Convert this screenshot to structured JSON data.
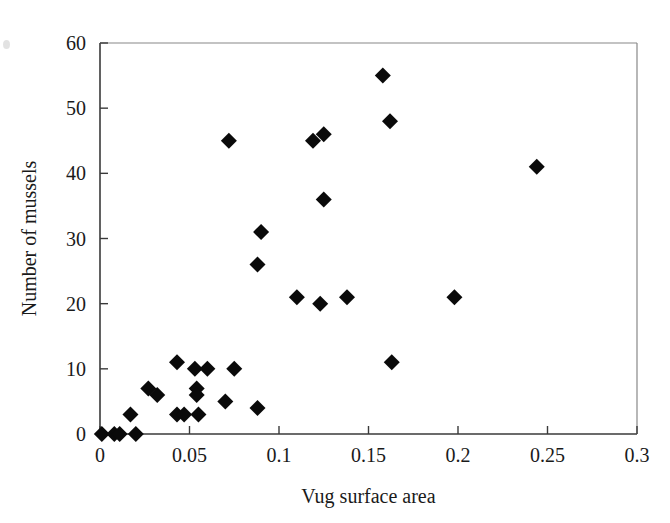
{
  "chart_data": {
    "type": "scatter",
    "title": "",
    "xlabel": "Vug surface area",
    "ylabel": "Number of mussels",
    "xlim": [
      0,
      0.3
    ],
    "ylim": [
      0,
      60
    ],
    "xticks": [
      0,
      0.05,
      0.1,
      0.15,
      0.2,
      0.25,
      0.3
    ],
    "xticklabels": [
      "0",
      "0.05",
      "0.1",
      "0.15",
      "0.2",
      "0.25",
      "0.3"
    ],
    "yticks": [
      0,
      10,
      20,
      30,
      40,
      50,
      60
    ],
    "yticklabels": [
      "0",
      "10",
      "20",
      "30",
      "40",
      "50",
      "60"
    ],
    "grid": false,
    "legend": false,
    "marker": "diamond",
    "marker_color": "#0a0a0a",
    "marker_size": 13,
    "points": [
      {
        "x": 0.001,
        "y": 0
      },
      {
        "x": 0.008,
        "y": 0
      },
      {
        "x": 0.011,
        "y": 0
      },
      {
        "x": 0.02,
        "y": 0
      },
      {
        "x": 0.017,
        "y": 3
      },
      {
        "x": 0.027,
        "y": 7
      },
      {
        "x": 0.032,
        "y": 6
      },
      {
        "x": 0.043,
        "y": 11
      },
      {
        "x": 0.043,
        "y": 3
      },
      {
        "x": 0.047,
        "y": 3
      },
      {
        "x": 0.053,
        "y": 10
      },
      {
        "x": 0.054,
        "y": 7
      },
      {
        "x": 0.054,
        "y": 6
      },
      {
        "x": 0.055,
        "y": 3
      },
      {
        "x": 0.06,
        "y": 10
      },
      {
        "x": 0.07,
        "y": 5
      },
      {
        "x": 0.072,
        "y": 45
      },
      {
        "x": 0.075,
        "y": 10
      },
      {
        "x": 0.088,
        "y": 4
      },
      {
        "x": 0.088,
        "y": 26
      },
      {
        "x": 0.09,
        "y": 31
      },
      {
        "x": 0.11,
        "y": 21
      },
      {
        "x": 0.119,
        "y": 45
      },
      {
        "x": 0.123,
        "y": 20
      },
      {
        "x": 0.125,
        "y": 46
      },
      {
        "x": 0.125,
        "y": 36
      },
      {
        "x": 0.138,
        "y": 21
      },
      {
        "x": 0.158,
        "y": 55
      },
      {
        "x": 0.162,
        "y": 48
      },
      {
        "x": 0.163,
        "y": 11
      },
      {
        "x": 0.198,
        "y": 21
      },
      {
        "x": 0.244,
        "y": 41
      }
    ]
  },
  "figure": {
    "background_color": "#ffffff",
    "axis_color": "#3a3a3a",
    "frame_color": "#888888",
    "text_color": "#1a1a1a"
  }
}
